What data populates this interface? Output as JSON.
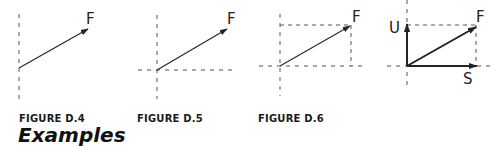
{
  "figures": [
    {
      "id": "D.4",
      "caption": "FIGURE D.4",
      "labels": {
        "force": "F"
      },
      "description": "Single force vector F drawn from a vertical dashed reference line"
    },
    {
      "id": "D.5",
      "caption": "FIGURE D.5",
      "labels": {
        "force": "F"
      },
      "description": "Force vector F drawn from origin of dashed horizontal and vertical axes"
    },
    {
      "id": "D.6",
      "caption": "FIGURE D.6",
      "labels": {
        "force": "F"
      },
      "description": "Force vector F within dashed rectangle on dashed axes"
    },
    {
      "id": "D.7",
      "caption": "",
      "labels": {
        "force": "F",
        "vertical_component": "U",
        "horizontal_component": "S"
      },
      "description": "Force F resolved into vertical component U and horizontal component S"
    }
  ],
  "section_heading": "Examples",
  "colors": {
    "line": "#222222",
    "dash": "#555555",
    "text": "#1a1a1a"
  }
}
